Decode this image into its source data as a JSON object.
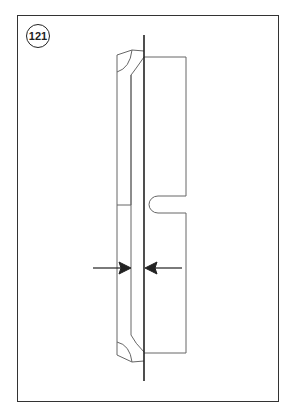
{
  "figure": {
    "number": "121",
    "line_color": "#555555",
    "axis_color": "#222222"
  }
}
